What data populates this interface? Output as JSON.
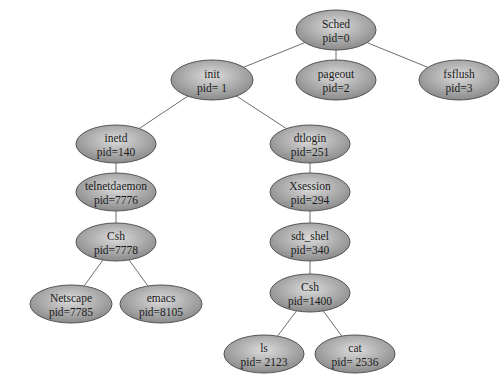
{
  "diagram": {
    "type": "process-tree",
    "edge_color": "#6e6e6e",
    "node_fill_center": "#dcdcdc",
    "node_fill_edge": "#8a8a8a",
    "node_stroke": "#555555",
    "nodes": [
      {
        "id": "sched",
        "name": "Sched",
        "pid": "pid=0",
        "cx": 336,
        "cy": 30,
        "rx": 40,
        "ry": 20
      },
      {
        "id": "init",
        "name": "init",
        "pid": "pid= 1",
        "cx": 212,
        "cy": 80,
        "rx": 41,
        "ry": 20
      },
      {
        "id": "pageout",
        "name": "pageout",
        "pid": "pid=2",
        "cx": 336,
        "cy": 80,
        "rx": 40,
        "ry": 20
      },
      {
        "id": "fsflush",
        "name": "fsflush",
        "pid": "pid=3",
        "cx": 459,
        "cy": 80,
        "rx": 40,
        "ry": 20
      },
      {
        "id": "inetd",
        "name": "inetd",
        "pid": "pid=140",
        "cx": 116,
        "cy": 144,
        "rx": 40,
        "ry": 19
      },
      {
        "id": "dtlogin",
        "name": "dtlogin",
        "pid": "pid=251",
        "cx": 310,
        "cy": 144,
        "rx": 40,
        "ry": 19
      },
      {
        "id": "telnetdaemon",
        "name": "telnetdaemon",
        "pid": "pid=7776",
        "cx": 116,
        "cy": 192,
        "rx": 40,
        "ry": 19
      },
      {
        "id": "xsession",
        "name": "Xsession",
        "pid": "pid=294",
        "cx": 310,
        "cy": 192,
        "rx": 40,
        "ry": 19
      },
      {
        "id": "csh7778",
        "name": "Csh",
        "pid": "pid=7778",
        "cx": 116,
        "cy": 242,
        "rx": 40,
        "ry": 19
      },
      {
        "id": "sdt_shel",
        "name": "sdt_shel",
        "pid": "pid=340",
        "cx": 310,
        "cy": 242,
        "rx": 40,
        "ry": 19
      },
      {
        "id": "netscape",
        "name": "Netscape",
        "pid": "pid=7785",
        "cx": 71,
        "cy": 304,
        "rx": 41,
        "ry": 19
      },
      {
        "id": "emacs",
        "name": "emacs",
        "pid": "pid=8105",
        "cx": 161,
        "cy": 304,
        "rx": 41,
        "ry": 19
      },
      {
        "id": "csh1400",
        "name": "Csh",
        "pid": "pid=1400",
        "cx": 310,
        "cy": 293,
        "rx": 40,
        "ry": 19
      },
      {
        "id": "ls",
        "name": "ls",
        "pid": "pid= 2123",
        "cx": 264,
        "cy": 354,
        "rx": 40,
        "ry": 19
      },
      {
        "id": "cat",
        "name": "cat",
        "pid": "pid= 2536",
        "cx": 355,
        "cy": 354,
        "rx": 40,
        "ry": 19
      }
    ],
    "edges": [
      {
        "from": "sched",
        "to": "init"
      },
      {
        "from": "sched",
        "to": "pageout"
      },
      {
        "from": "sched",
        "to": "fsflush"
      },
      {
        "from": "init",
        "to": "inetd"
      },
      {
        "from": "init",
        "to": "dtlogin"
      },
      {
        "from": "inetd",
        "to": "telnetdaemon"
      },
      {
        "from": "telnetdaemon",
        "to": "csh7778"
      },
      {
        "from": "csh7778",
        "to": "netscape"
      },
      {
        "from": "csh7778",
        "to": "emacs"
      },
      {
        "from": "dtlogin",
        "to": "xsession"
      },
      {
        "from": "xsession",
        "to": "sdt_shel"
      },
      {
        "from": "sdt_shel",
        "to": "csh1400"
      },
      {
        "from": "csh1400",
        "to": "ls"
      },
      {
        "from": "csh1400",
        "to": "cat"
      }
    ]
  }
}
